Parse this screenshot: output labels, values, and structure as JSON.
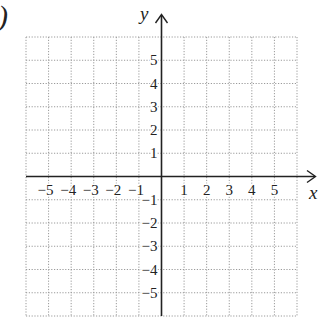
{
  "figure": {
    "corner_label": ")",
    "x_axis_label": "x",
    "y_axis_label": "y",
    "grid": {
      "x_min": -6,
      "x_max": 6,
      "y_min": -6,
      "y_max": 6,
      "step": 1,
      "style": "dotted",
      "color": "#9a9a9a"
    },
    "axis_color": "#222222",
    "x_tick_labels": [
      {
        "value": -5,
        "text": "−5"
      },
      {
        "value": -4,
        "text": "−4"
      },
      {
        "value": -3,
        "text": "−3"
      },
      {
        "value": -2,
        "text": "−2"
      },
      {
        "value": -1,
        "text": "−1"
      },
      {
        "value": 1,
        "text": "1"
      },
      {
        "value": 2,
        "text": "2"
      },
      {
        "value": 3,
        "text": "3"
      },
      {
        "value": 4,
        "text": "4"
      },
      {
        "value": 5,
        "text": "5"
      }
    ],
    "y_tick_labels": [
      {
        "value": 5,
        "text": "5"
      },
      {
        "value": 4,
        "text": "4"
      },
      {
        "value": 3,
        "text": "3"
      },
      {
        "value": 2,
        "text": "2"
      },
      {
        "value": 1,
        "text": "1"
      },
      {
        "value": -1,
        "text": "−1"
      },
      {
        "value": -2,
        "text": "−2"
      },
      {
        "value": -3,
        "text": "−3"
      },
      {
        "value": -4,
        "text": "−4"
      },
      {
        "value": -5,
        "text": "−5"
      }
    ]
  }
}
